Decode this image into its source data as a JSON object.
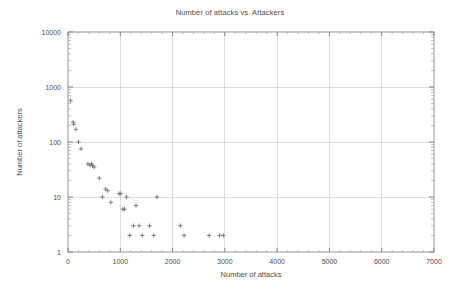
{
  "chart_data": {
    "type": "scatter",
    "title": "Number of attacks vs. Attackers",
    "xlabel": "Number of attacks",
    "ylabel": "Number of attackers",
    "xscale": "linear",
    "yscale": "log",
    "xlim": [
      0,
      7000
    ],
    "ylim": [
      1,
      10000
    ],
    "xticks": [
      0,
      1000,
      2000,
      3000,
      4000,
      5000,
      6000,
      7000
    ],
    "xtick_labels": [
      "0",
      "1000",
      "2000",
      "3000",
      "4000",
      "5000",
      "6000",
      "7000"
    ],
    "yticks": [
      1,
      10,
      100,
      1000,
      10000
    ],
    "ytick_labels": [
      "1",
      "10",
      "100",
      "1000",
      "10000"
    ],
    "grid": true,
    "legend": false,
    "marker": "plus",
    "marker_color": "#6e6e6e",
    "background": "#ffffff",
    "series": [
      {
        "name": "attackers",
        "points": [
          [
            50,
            560
          ],
          [
            100,
            230
          ],
          [
            110,
            210
          ],
          [
            150,
            170
          ],
          [
            200,
            100
          ],
          [
            250,
            75
          ],
          [
            380,
            40
          ],
          [
            420,
            38
          ],
          [
            450,
            40
          ],
          [
            470,
            37
          ],
          [
            500,
            35
          ],
          [
            600,
            22
          ],
          [
            660,
            10
          ],
          [
            720,
            14
          ],
          [
            760,
            13
          ],
          [
            820,
            8
          ],
          [
            980,
            11.5
          ],
          [
            1010,
            11.5
          ],
          [
            1050,
            6
          ],
          [
            1080,
            6
          ],
          [
            1120,
            10
          ],
          [
            1180,
            2
          ],
          [
            1250,
            3
          ],
          [
            1300,
            7
          ],
          [
            1360,
            3
          ],
          [
            1420,
            2
          ],
          [
            1560,
            3
          ],
          [
            1640,
            2
          ],
          [
            1700,
            10
          ],
          [
            2150,
            3
          ],
          [
            2220,
            2
          ],
          [
            2700,
            2
          ],
          [
            2900,
            2
          ],
          [
            2970,
            2
          ]
        ]
      }
    ]
  },
  "axes": {
    "x_title": "Number of attacks",
    "y_title": "Number of attackers"
  }
}
